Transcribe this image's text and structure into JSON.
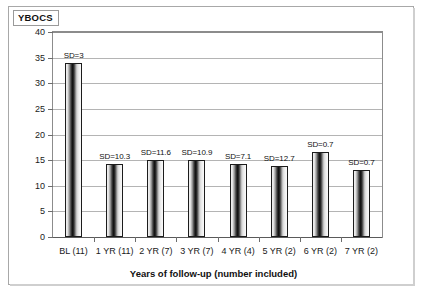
{
  "figure": {
    "title": "YBOCS"
  },
  "chart_data": {
    "type": "bar",
    "title": "YBOCS",
    "xlabel": "Years of follow-up (number included)",
    "ylabel": "YBOCS",
    "ylim": [
      0,
      40
    ],
    "ytick_step": 5,
    "yticks": [
      "0",
      "5",
      "10",
      "15",
      "20",
      "25",
      "30",
      "35",
      "40"
    ],
    "grid": true,
    "legend": "none",
    "categories": [
      "BL (11)",
      "1 YR (11)",
      "2 YR (7)",
      "3 YR (7)",
      "4 YR (4)",
      "5 YR (2)",
      "6 YR (2)",
      "7 YR (2)"
    ],
    "values": [
      34,
      14.3,
      15,
      15.1,
      14.2,
      13.8,
      16.6,
      13
    ],
    "annotations": [
      "SD=3",
      "SD=10.3",
      "SD=11.6",
      "SD=10.9",
      "SD=7.1",
      "SD=12.7",
      "SD=0.7",
      "SD=0.7"
    ],
    "colors": {
      "bar_edge": "#1c1c1c",
      "grid": "#b4b4b4",
      "axis": "#5a5a5a",
      "text": "#111111"
    }
  }
}
